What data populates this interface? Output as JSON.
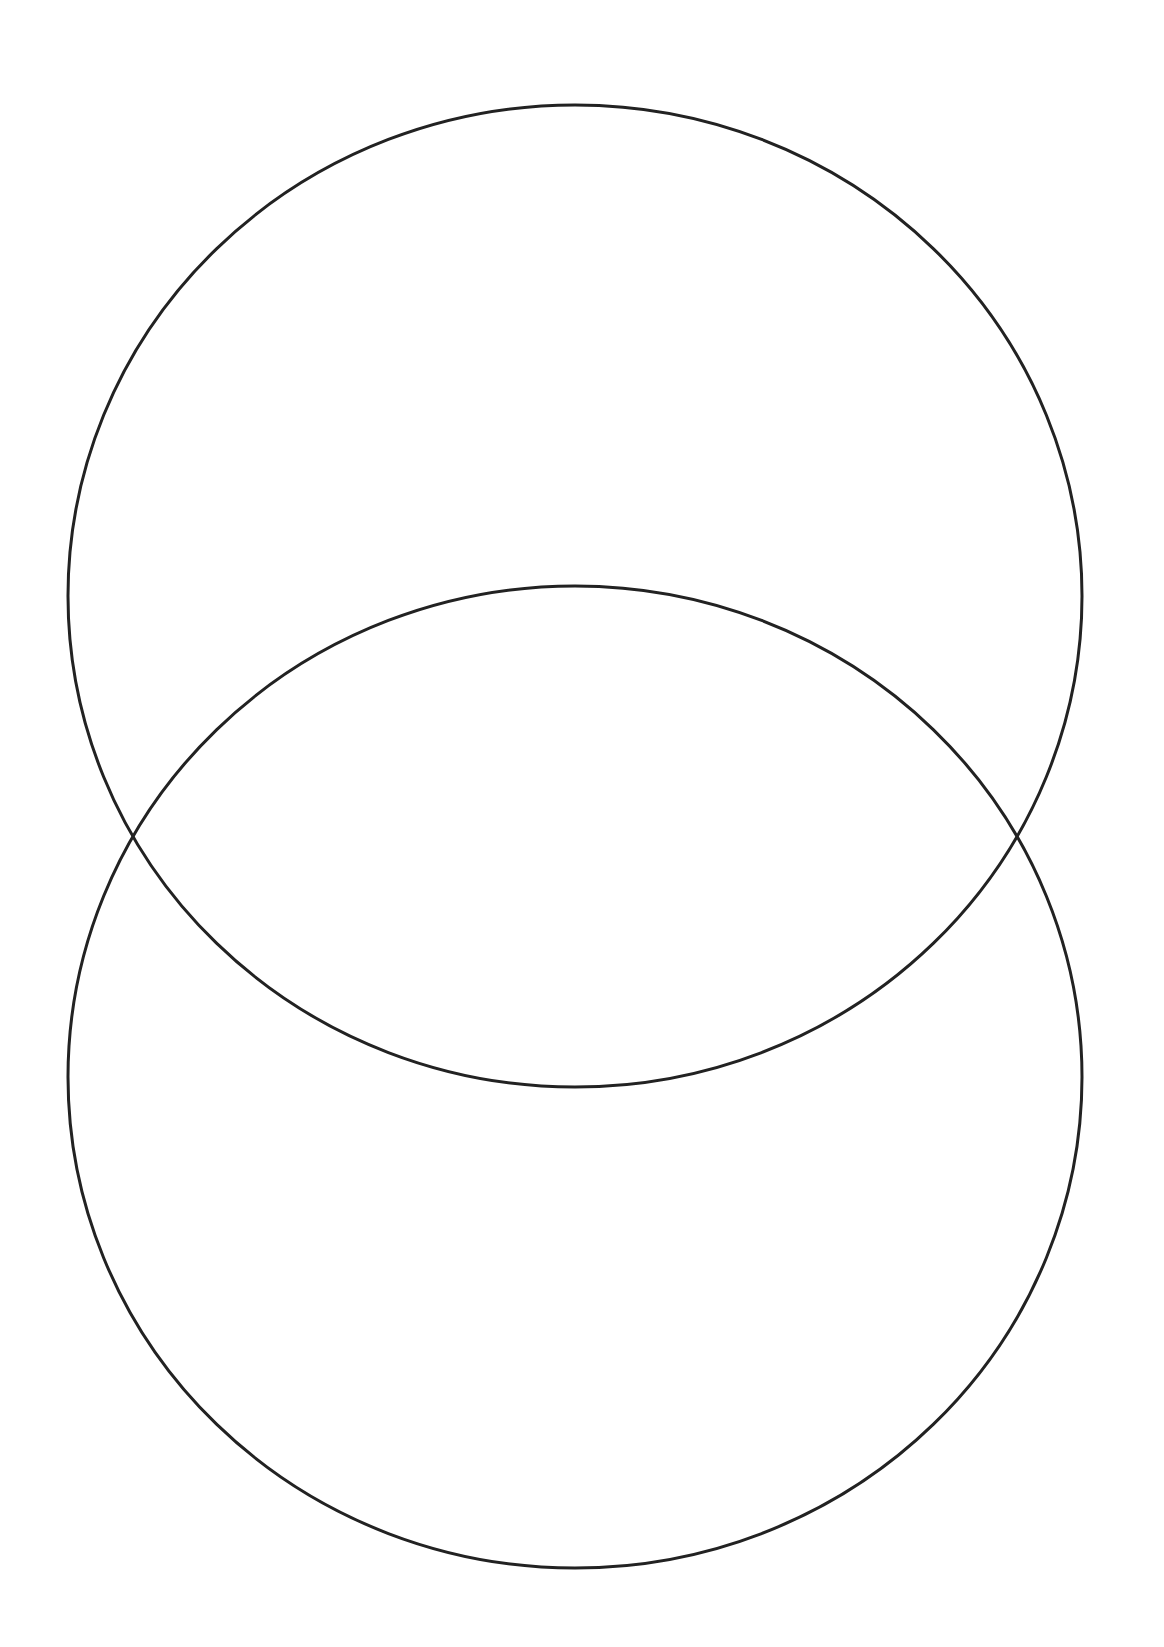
{
  "diagram": {
    "type": "venn-diagram",
    "orientation": "vertical",
    "background_color": "#ffffff",
    "stroke_color": "#222222",
    "stroke_width": 3,
    "sets": [
      {
        "id": "top",
        "label": "",
        "cx": 575,
        "cy": 596,
        "rx": 507,
        "ry": 491
      },
      {
        "id": "bottom",
        "label": "",
        "cx": 575,
        "cy": 1077,
        "rx": 507,
        "ry": 491
      }
    ],
    "intersection_label": ""
  }
}
